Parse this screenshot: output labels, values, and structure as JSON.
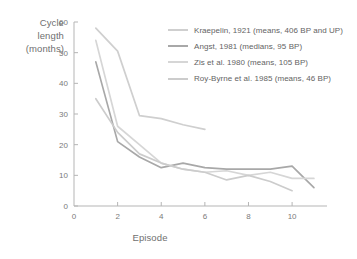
{
  "chart_data": {
    "type": "line",
    "title": "",
    "xlabel": "Episode",
    "ylabel": "Cycle length (months)",
    "ylabel_lines": [
      "Cycle",
      "length",
      "(months)"
    ],
    "xlim": [
      0,
      11.6
    ],
    "ylim": [
      0,
      60
    ],
    "xticks": [
      0,
      2,
      4,
      6,
      8,
      10
    ],
    "xtick_labels": [
      "0",
      "2",
      "4",
      "6",
      "8",
      "10"
    ],
    "yticks": [
      0,
      10,
      20,
      30,
      40,
      50,
      60
    ],
    "ytick_labels": [
      "0",
      "10",
      "20",
      "30",
      "40",
      "50",
      "60"
    ],
    "grid": false,
    "legend_position": "upper right",
    "series": [
      {
        "name": "Kraepelin, 1921 (means, 406 BP and UP)",
        "color": "#cfcfcf",
        "x": [
          1,
          2,
          3,
          4,
          5,
          6
        ],
        "values": [
          58,
          50.5,
          29.5,
          28.5,
          26.5,
          25
        ]
      },
      {
        "name": "Angst, 1981 (medians, 95 BP)",
        "color": "#a8a8a8",
        "x": [
          1,
          2,
          3,
          4,
          5,
          6,
          7,
          8,
          9,
          10,
          11
        ],
        "values": [
          47,
          21,
          16,
          12.5,
          14,
          12.5,
          12,
          12,
          12,
          13,
          6
        ]
      },
      {
        "name": "Zis et al. 1980 (means, 105 BP)",
        "color": "#d6d6d6",
        "x": [
          1,
          2,
          3,
          4,
          5,
          6,
          7,
          8,
          9,
          10,
          11
        ],
        "values": [
          54,
          26,
          20,
          14,
          12,
          11,
          11.5,
          10,
          11,
          9,
          9
        ]
      },
      {
        "name": "Roy-Byrne et al. 1985 (means, 46 BP)",
        "color": "#cccccc",
        "x": [
          1,
          2,
          3,
          4,
          5,
          6,
          7,
          8,
          9,
          10
        ],
        "values": [
          35,
          24,
          17,
          14,
          12,
          11,
          8.5,
          10,
          8,
          5
        ]
      }
    ]
  },
  "axis_color": "#b5b5b5"
}
